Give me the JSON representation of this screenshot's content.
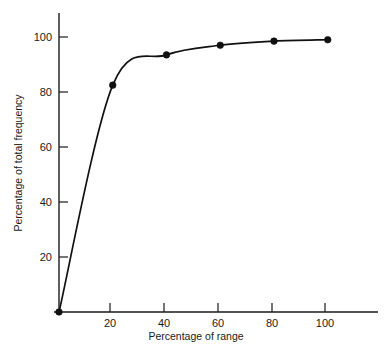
{
  "chart_data": {
    "type": "line",
    "title": "",
    "subtitle": "",
    "xlabel": "Percentage of range",
    "ylabel": "Percentage of total frequency",
    "xlim": [
      0,
      118
    ],
    "ylim": [
      0,
      108
    ],
    "grid": false,
    "legend": null,
    "line_color": "#111111",
    "marker": "filled-circle",
    "marker_color": "#111111",
    "background_color": "#ffffff",
    "axis_color": "#1a1a1a",
    "x_ticks": [
      20,
      40,
      60,
      80,
      100
    ],
    "x_tick_labels": [
      "20",
      "40",
      "60",
      "80",
      "100"
    ],
    "y_ticks": [
      20,
      40,
      60,
      80,
      100
    ],
    "y_tick_labels": [
      "20",
      "40",
      "60",
      "80",
      "100"
    ],
    "x": [
      0,
      20,
      40,
      60,
      80,
      100
    ],
    "values": [
      0,
      82.5,
      93.5,
      97,
      98.5,
      99
    ],
    "points": [
      {
        "x": 0,
        "y": 0
      },
      {
        "x": 20,
        "y": 82.5
      },
      {
        "x": 40,
        "y": 93.5
      },
      {
        "x": 60,
        "y": 97
      },
      {
        "x": 80,
        "y": 98.5
      },
      {
        "x": 100,
        "y": 99
      }
    ],
    "annotations": []
  },
  "axes": {
    "x_title": "Percentage of range",
    "y_title": "Percentage of total frequency",
    "x_tick_labels": [
      "20",
      "40",
      "60",
      "80",
      "100"
    ],
    "y_tick_labels": [
      "20",
      "40",
      "60",
      "80",
      "100"
    ]
  }
}
